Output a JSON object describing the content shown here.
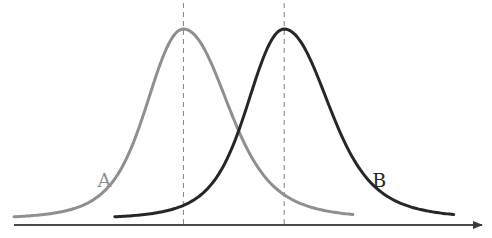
{
  "chart_data": {
    "type": "line",
    "title": "",
    "xlabel": "",
    "ylabel": "",
    "grid": false,
    "legend": "none",
    "x_axis": {
      "arrow": true,
      "range": [
        0,
        10
      ]
    },
    "y_axis": {
      "visible": false,
      "range": [
        0,
        1
      ]
    },
    "series": [
      {
        "name": "A",
        "label": "A",
        "color": "#8f8f8f",
        "peak_x": 3.7,
        "peak_y": 1.0,
        "x_start": 0.0,
        "x_end": 7.4,
        "skew": "right",
        "mean_marker": true
      },
      {
        "name": "B",
        "label": "B",
        "color": "#262626",
        "peak_x": 5.9,
        "peak_y": 1.0,
        "x_start": 2.2,
        "x_end": 9.6,
        "skew": "right",
        "mean_marker": true
      }
    ],
    "annotations": [
      {
        "type": "vline",
        "x": 3.7,
        "style": "dashed",
        "series": "A"
      },
      {
        "type": "vline",
        "x": 5.9,
        "style": "dashed",
        "series": "B"
      }
    ]
  }
}
